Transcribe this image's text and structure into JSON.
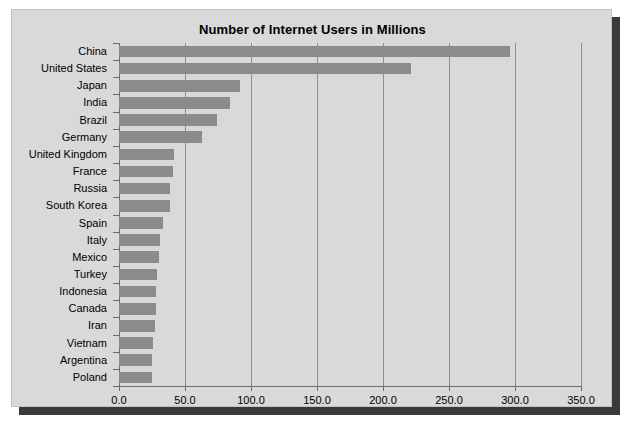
{
  "chart_data": {
    "type": "bar",
    "orientation": "horizontal",
    "title": "Number of Internet Users in Millions",
    "xlabel": "",
    "ylabel": "",
    "xlim": [
      0,
      350
    ],
    "ylim": null,
    "grid": true,
    "legend": null,
    "xticks": [
      "0.0",
      "50.0",
      "100.0",
      "150.0",
      "200.0",
      "250.0",
      "300.0",
      "350.0"
    ],
    "xtick_values": [
      0,
      50,
      100,
      150,
      200,
      250,
      300,
      350
    ],
    "categories": [
      "China",
      "United States",
      "Japan",
      "India",
      "Brazil",
      "Germany",
      "United Kingdom",
      "France",
      "Russia",
      "South Korea",
      "Spain",
      "Italy",
      "Mexico",
      "Turkey",
      "Indonesia",
      "Canada",
      "Iran",
      "Vietnam",
      "Argentina",
      "Poland"
    ],
    "values": [
      296,
      221,
      92,
      84,
      74,
      63,
      42,
      41,
      39,
      39,
      33,
      31,
      30,
      29,
      28,
      28,
      27,
      26,
      25,
      25
    ],
    "bar_color": "#8b8b8b",
    "plot_background": "#d9d9d9",
    "axis_color": "#6d6d6d",
    "gridline_color": "#8e8e8e"
  },
  "panel": {
    "background": "#d9d9d9",
    "shadow_color": "#3a3a3a"
  }
}
